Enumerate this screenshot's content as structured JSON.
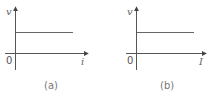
{
  "panels": [
    {
      "caption": "(a)",
      "y_label": "v",
      "x_label": "i",
      "origin_label": "0",
      "line": "constant"
    },
    {
      "caption": "(b)",
      "y_label": "v",
      "x_label": "I",
      "origin_label": "0",
      "line": "constant"
    }
  ],
  "colors": {
    "axis": "#555555",
    "line": "#666666",
    "text": "#666666"
  }
}
